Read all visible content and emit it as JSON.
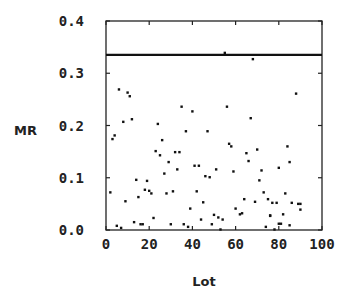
{
  "chart_data": {
    "type": "scatter",
    "title": "",
    "xlabel": "Lot",
    "ylabel": "MR",
    "xlim": [
      0,
      100
    ],
    "ylim": [
      0.0,
      0.4
    ],
    "xticks": [
      0,
      20,
      40,
      60,
      80,
      100
    ],
    "xtick_labels": [
      "0",
      "20",
      "40",
      "60",
      "80",
      "100"
    ],
    "yticks": [
      0.0,
      0.1,
      0.2,
      0.3,
      0.4
    ],
    "ytick_labels": [
      "0.0",
      "0.1",
      "0.2",
      "0.3",
      "0.4"
    ],
    "grid": false,
    "legend": null,
    "reference_lines": [
      {
        "name": "upper-control-limit",
        "orientation": "horizontal",
        "y": 0.335,
        "color": "#111111"
      }
    ],
    "series": [
      {
        "name": "MR",
        "marker": "square-dot",
        "color": "#111111",
        "x": [
          2,
          3,
          4,
          5,
          6,
          7,
          8,
          9,
          10,
          11,
          12,
          13,
          14,
          15,
          16,
          17,
          18,
          19,
          20,
          21,
          22,
          23,
          24,
          25,
          26,
          27,
          28,
          29,
          30,
          31,
          32,
          33,
          34,
          35,
          36,
          37,
          38,
          39,
          40,
          41,
          42,
          43,
          44,
          45,
          46,
          47,
          48,
          49,
          50,
          51,
          52,
          53,
          54,
          55,
          56,
          57,
          58,
          59,
          60,
          62,
          63,
          64,
          65,
          66,
          67,
          68,
          69,
          70,
          71,
          72,
          73,
          74,
          75,
          76,
          76,
          77,
          78,
          79,
          80,
          80,
          81,
          82,
          83,
          84,
          85,
          85,
          86,
          88,
          89,
          90,
          90
        ],
        "y": [
          0.072,
          0.174,
          0.181,
          0.008,
          0.269,
          0.004,
          0.207,
          0.055,
          0.263,
          0.256,
          0.212,
          0.015,
          0.096,
          0.063,
          0.011,
          0.011,
          0.077,
          0.094,
          0.075,
          0.07,
          0.023,
          0.151,
          0.203,
          0.143,
          0.172,
          0.108,
          0.07,
          0.13,
          0.011,
          0.074,
          0.149,
          0.116,
          0.149,
          0.236,
          0.011,
          0.189,
          0.006,
          0.041,
          0.227,
          0.123,
          0.074,
          0.123,
          0.02,
          0.053,
          0.103,
          0.189,
          0.101,
          0.011,
          0.029,
          0.116,
          0.024,
          0.001,
          0.02,
          0.339,
          0.236,
          0.165,
          0.16,
          0.112,
          0.041,
          0.03,
          0.032,
          0.059,
          0.147,
          0.132,
          0.214,
          0.327,
          0.054,
          0.154,
          0.095,
          0.114,
          0.072,
          0.006,
          0.059,
          0.027,
          0.028,
          0.052,
          0.001,
          0.052,
          0.012,
          0.119,
          0.012,
          0.03,
          0.07,
          0.16,
          0.009,
          0.13,
          0.052,
          0.261,
          0.05,
          0.039,
          0.05
        ]
      }
    ]
  }
}
